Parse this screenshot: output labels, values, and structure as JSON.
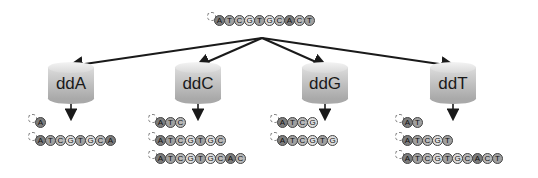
{
  "template": {
    "sequence": "ATCGTGCACT",
    "position": {
      "x": 207,
      "y": 14
    }
  },
  "colors": {
    "A": "#7d7d7d",
    "T": "#a0a0a0",
    "C": "#b9b9b9",
    "G": "#dedede",
    "arrow": "#1a1a1a"
  },
  "reactions": [
    {
      "label": "ddA",
      "cylinder": {
        "x": 48,
        "y": 62
      },
      "products": [
        {
          "sequence": "A",
          "x": 28,
          "y": 116
        },
        {
          "sequence": "ATCGTGCA",
          "x": 28,
          "y": 134
        }
      ]
    },
    {
      "label": "ddC",
      "cylinder": {
        "x": 175,
        "y": 62
      },
      "products": [
        {
          "sequence": "ATC",
          "x": 148,
          "y": 116
        },
        {
          "sequence": "ATCGTGC",
          "x": 148,
          "y": 134
        },
        {
          "sequence": "ATCGTGCAC",
          "x": 148,
          "y": 152
        }
      ]
    },
    {
      "label": "ddG",
      "cylinder": {
        "x": 302,
        "y": 62
      },
      "products": [
        {
          "sequence": "ATCG",
          "x": 270,
          "y": 116
        },
        {
          "sequence": "ATCGTG",
          "x": 270,
          "y": 134
        }
      ]
    },
    {
      "label": "ddT",
      "cylinder": {
        "x": 430,
        "y": 62
      },
      "products": [
        {
          "sequence": "AT",
          "x": 395,
          "y": 116
        },
        {
          "sequence": "ATCGT",
          "x": 395,
          "y": 134
        },
        {
          "sequence": "ATCGTGCACT",
          "x": 395,
          "y": 152
        }
      ]
    }
  ],
  "arrow_origin": {
    "x": 262,
    "y": 38
  }
}
